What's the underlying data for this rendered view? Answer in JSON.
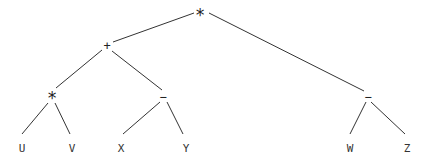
{
  "diagram": {
    "type": "expression-tree",
    "nodes": [
      {
        "id": "n0",
        "label": "*",
        "x": 200,
        "y": 14,
        "kind": "operator",
        "size": "big"
      },
      {
        "id": "n1",
        "label": "+",
        "x": 107,
        "y": 46,
        "kind": "operator",
        "size": "small"
      },
      {
        "id": "n2",
        "label": "*",
        "x": 52,
        "y": 97,
        "kind": "operator",
        "size": "big"
      },
      {
        "id": "n3",
        "label": "−",
        "x": 163,
        "y": 97,
        "kind": "operator",
        "size": "small"
      },
      {
        "id": "n4",
        "label": "−",
        "x": 368,
        "y": 97,
        "kind": "operator",
        "size": "small"
      },
      {
        "id": "n5",
        "label": "U",
        "x": 22,
        "y": 148,
        "kind": "leaf"
      },
      {
        "id": "n6",
        "label": "V",
        "x": 72,
        "y": 148,
        "kind": "leaf"
      },
      {
        "id": "n7",
        "label": "X",
        "x": 121,
        "y": 148,
        "kind": "leaf"
      },
      {
        "id": "n8",
        "label": "Y",
        "x": 186,
        "y": 148,
        "kind": "leaf"
      },
      {
        "id": "n9",
        "label": "W",
        "x": 350,
        "y": 148,
        "kind": "leaf"
      },
      {
        "id": "n10",
        "label": "Z",
        "x": 407,
        "y": 148,
        "kind": "leaf"
      }
    ],
    "edges": [
      {
        "from": "n0",
        "to": "n1",
        "x1": 194,
        "y1": 13,
        "x2": 113,
        "y2": 42
      },
      {
        "from": "n0",
        "to": "n4",
        "x1": 209,
        "y1": 13,
        "x2": 364,
        "y2": 91
      },
      {
        "from": "n1",
        "to": "n2",
        "x1": 102,
        "y1": 50,
        "x2": 56,
        "y2": 88
      },
      {
        "from": "n1",
        "to": "n3",
        "x1": 112,
        "y1": 51,
        "x2": 162,
        "y2": 90
      },
      {
        "from": "n2",
        "to": "n5",
        "x1": 48,
        "y1": 103,
        "x2": 22,
        "y2": 134
      },
      {
        "from": "n2",
        "to": "n6",
        "x1": 55,
        "y1": 103,
        "x2": 70,
        "y2": 134
      },
      {
        "from": "n3",
        "to": "n7",
        "x1": 160,
        "y1": 102,
        "x2": 123,
        "y2": 134
      },
      {
        "from": "n3",
        "to": "n8",
        "x1": 167,
        "y1": 102,
        "x2": 183,
        "y2": 134
      },
      {
        "from": "n4",
        "to": "n9",
        "x1": 366,
        "y1": 102,
        "x2": 350,
        "y2": 134
      },
      {
        "from": "n4",
        "to": "n10",
        "x1": 371,
        "y1": 102,
        "x2": 405,
        "y2": 134
      }
    ]
  }
}
